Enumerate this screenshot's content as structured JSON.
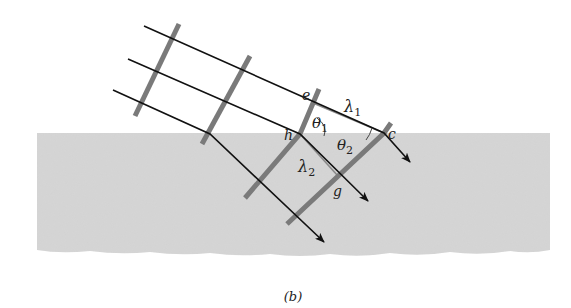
{
  "figure": {
    "caption": "(b)",
    "colors": {
      "background": "#ffffff",
      "medium2": "#d6d6d6",
      "ray": "#111111",
      "wavefront": "#7a7a7a",
      "construction_line": "#8a8a8a",
      "text": "#222222"
    },
    "labels": {
      "e": "e",
      "h": "h",
      "c": "c",
      "g": "g",
      "lambda1": "λ",
      "lambda1_sub": "1",
      "lambda2": "λ",
      "lambda2_sub": "2",
      "theta1": "θ",
      "theta1_sub": "1",
      "theta2": "θ",
      "theta2_sub": "2"
    }
  }
}
